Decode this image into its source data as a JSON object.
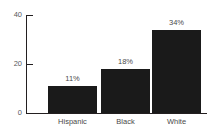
{
  "chart_data": {
    "type": "bar",
    "title": "",
    "xlabel": "",
    "ylabel": "",
    "categories": [
      "Hispanic",
      "Black",
      "White"
    ],
    "values": [
      11,
      18,
      34
    ],
    "data_labels": [
      "11%",
      "18%",
      "34%"
    ],
    "ylim": [
      0,
      40
    ],
    "yticks": [
      0,
      20,
      40
    ],
    "ytick_labels": [
      "0",
      "20",
      "40"
    ],
    "grid": false,
    "legend": false,
    "bar_color": "#1a1a1a",
    "axis_color": "#231f20",
    "text_color": "#4a4a4a",
    "background": "#ffffff"
  },
  "axis": {
    "ytick_40": "40",
    "ytick_20": "20",
    "ytick_0": "0"
  },
  "bars": [
    {
      "label": "Hispanic",
      "value_label": "11%"
    },
    {
      "label": "Black",
      "value_label": "18%"
    },
    {
      "label": "White",
      "value_label": "34%"
    }
  ]
}
